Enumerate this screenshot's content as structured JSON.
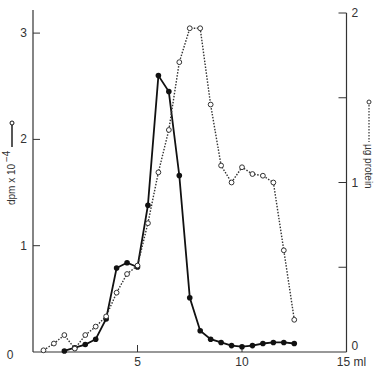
{
  "chart_data": {
    "type": "line",
    "title": "",
    "xlabel": "ml",
    "ylabel": "dpm x 10^-4",
    "y2label": "µg protein",
    "xlim": [
      0,
      15
    ],
    "ylim": [
      0,
      3.25
    ],
    "y2lim": [
      0,
      2
    ],
    "x_ticks": [
      0,
      5,
      10,
      15
    ],
    "x_tick_labels": [
      "0",
      "5",
      "10",
      "15 ml"
    ],
    "y_ticks": [
      0,
      1,
      2,
      3
    ],
    "y_tick_labels": [
      "0",
      "1",
      "2",
      "3"
    ],
    "y2_ticks": [
      0,
      0.5,
      1,
      1.5,
      2
    ],
    "y2_tick_labels": [
      "0",
      "",
      "1",
      "",
      "2"
    ],
    "grid": false,
    "legend": "axis labels with line samples",
    "series": [
      {
        "name": "dpm x 10^-4",
        "axis": "left",
        "style": "solid",
        "marker": "filled-circle",
        "color": "#111111",
        "x": [
          1.5,
          2.0,
          2.5,
          3.0,
          3.5,
          4.0,
          4.5,
          5.0,
          5.5,
          6.0,
          6.5,
          7.0,
          7.5,
          8.0,
          8.5,
          9.0,
          9.5,
          10.0,
          10.5,
          11.0,
          11.5,
          12.0,
          12.5
        ],
        "values": [
          0.01,
          0.04,
          0.07,
          0.12,
          0.31,
          0.79,
          0.84,
          0.8,
          1.38,
          2.6,
          2.45,
          1.66,
          0.51,
          0.2,
          0.12,
          0.09,
          0.06,
          0.05,
          0.06,
          0.08,
          0.09,
          0.09,
          0.08
        ]
      },
      {
        "name": "µg protein",
        "axis": "right",
        "style": "dotted",
        "marker": "open-circle",
        "color": "#333333",
        "x": [
          0.5,
          1.0,
          1.5,
          2.0,
          2.5,
          3.0,
          3.5,
          4.0,
          4.5,
          5.0,
          5.5,
          6.0,
          6.5,
          7.0,
          7.5,
          8.0,
          8.5,
          9.0,
          9.5,
          10.0,
          10.5,
          11.0,
          11.5,
          12.0,
          12.5
        ],
        "values": [
          0.01,
          0.05,
          0.1,
          0.02,
          0.1,
          0.15,
          0.21,
          0.35,
          0.46,
          0.51,
          0.76,
          1.06,
          1.31,
          1.71,
          1.91,
          1.91,
          1.46,
          1.1,
          1.0,
          1.09,
          1.05,
          1.04,
          1.0,
          0.6,
          0.19
        ]
      }
    ]
  },
  "labels": {
    "left_axis_title": "dpm x 10",
    "left_axis_exp": "−4",
    "right_axis_title": "µg protein"
  }
}
